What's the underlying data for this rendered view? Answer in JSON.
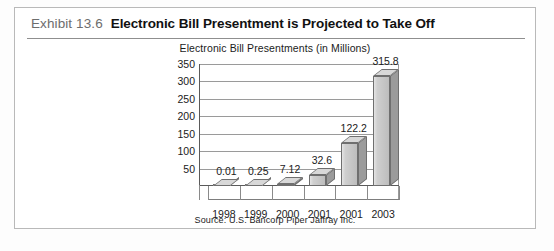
{
  "exhibit": {
    "number": "Exhibit 13.6",
    "title": "Electronic Bill Presentment is Projected to Take Off"
  },
  "source": "Source: U.S. Bancorp Piper Jaffray Inc.",
  "chart_data": {
    "type": "bar",
    "title": "Electronic Bill Presentments (in Millions)",
    "subtitle": "",
    "xlabel": "",
    "ylabel": "",
    "categories": [
      "1998",
      "1999",
      "2000",
      "2001",
      "2001",
      "2003"
    ],
    "values": [
      0.01,
      0.25,
      7.12,
      32.6,
      122.2,
      315.8
    ],
    "value_labels": [
      "0.01",
      "0.25",
      "7.12",
      "32.6",
      "122.2",
      "315.8"
    ],
    "yticks": [
      50,
      100,
      150,
      200,
      250,
      300,
      350
    ],
    "ytick_labels": [
      "50",
      "100",
      "150",
      "200",
      "250",
      "300",
      "350"
    ],
    "ylim": [
      0,
      350
    ],
    "grid": true,
    "legend": false,
    "style": "3d-column",
    "bar_color": "#c6c6c6",
    "bar_side_color": "#9b9b9b",
    "bar_edge_color": "#6f6f6f"
  }
}
